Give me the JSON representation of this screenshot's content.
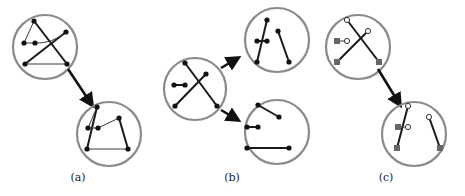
{
  "figure": {
    "panels": [
      {
        "id": "a",
        "label": "(a)"
      },
      {
        "id": "b",
        "label": "(b)"
      },
      {
        "id": "c",
        "label": "(c)"
      }
    ]
  },
  "colors": {
    "circle_outline": "#8a8a8a",
    "edge": "#1a1a1a",
    "node_filled": "#111111",
    "node_square": "#666666",
    "node_open": "#ffffff"
  }
}
